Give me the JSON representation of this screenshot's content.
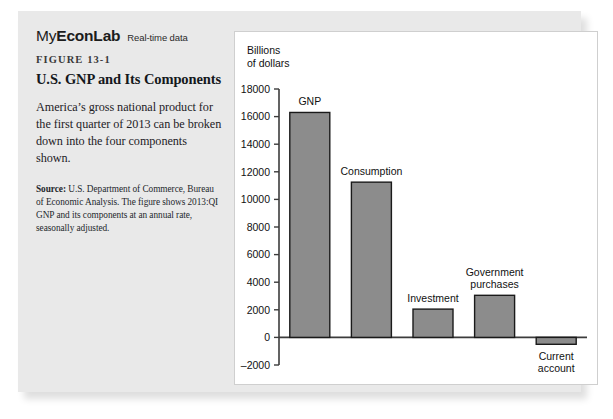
{
  "branding": {
    "name_light": "My",
    "name_bold": "EconLab",
    "tagline": "Real-time data"
  },
  "caption": {
    "figure_number": "FIGURE 13-1",
    "title": "U.S. GNP and Its Components",
    "body": "America’s gross national product for the first quarter of 2013 can be broken down into the four components shown.",
    "source_label": "Source:",
    "source_text": " U.S. Department of Commerce, Bureau of Economic Analysis. The figure shows 2013:QI GNP and its components at an annual rate, seasonally adjusted."
  },
  "chart_data": {
    "type": "bar",
    "title": "",
    "axis_title": "Billions of dollars",
    "axis_title_line1": "Billions",
    "axis_title_line2": "of dollars",
    "xlabel": "",
    "ylabel": "Billions of dollars",
    "ylim": [
      -2000,
      18000
    ],
    "ytick_step": 2000,
    "ytick_labels": [
      "18000",
      "16000",
      "14000",
      "12000",
      "10000",
      "8000",
      "6000",
      "4000",
      "2000",
      "0",
      "–2000"
    ],
    "ytick_values": [
      18000,
      16000,
      14000,
      12000,
      10000,
      8000,
      6000,
      4000,
      2000,
      0,
      -2000
    ],
    "grid": false,
    "legend": "none",
    "categories": [
      "GNP",
      "Consumption",
      "Investment",
      "Government purchases",
      "Current account"
    ],
    "values": [
      16300,
      11250,
      2050,
      3050,
      -500
    ],
    "bar_labels": [
      {
        "text": "GNP",
        "lines": [
          "GNP"
        ],
        "position": "above"
      },
      {
        "text": "Consumption",
        "lines": [
          "Consumption"
        ],
        "position": "above"
      },
      {
        "text": "Investment",
        "lines": [
          "Investment"
        ],
        "position": "above"
      },
      {
        "text": "Government purchases",
        "lines": [
          "Government",
          "purchases"
        ],
        "position": "above"
      },
      {
        "text": "Current account",
        "lines": [
          "Current",
          "account"
        ],
        "position": "below"
      }
    ],
    "bar_fill": "#8c8c8c",
    "bar_stroke": "#1a1a1a",
    "axis_color": "#3c3c3c"
  },
  "colors": {
    "card_background": "#e9e9e9",
    "panel_background": "#ffffff",
    "text": "#1d2126"
  }
}
